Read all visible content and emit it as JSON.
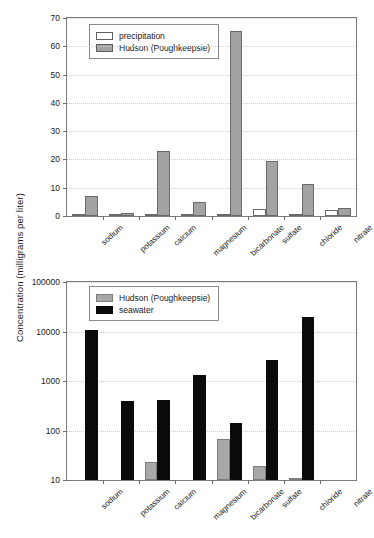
{
  "figure": {
    "y_axis_title": "Concentration (milligrams per liter)"
  },
  "chart_data": [
    {
      "type": "bar",
      "title": "",
      "panel": "top",
      "xlabel": "",
      "ylabel": "Concentration (milligrams per liter)",
      "ylim": [
        0,
        70
      ],
      "yscale": "linear",
      "yticks": [
        0,
        10,
        20,
        30,
        40,
        50,
        60,
        70
      ],
      "ytick_labels": [
        "0",
        "10",
        "20",
        "30",
        "40",
        "50",
        "60",
        "70"
      ],
      "grid": true,
      "legend_position": "upper left",
      "categories": [
        "sodium",
        "potassium",
        "calcium",
        "magnesium",
        "bicarbonate",
        "sulfate",
        "chloride",
        "nitrate"
      ],
      "series": [
        {
          "name": "precipitation",
          "color": "#ffffff",
          "values": [
            0.3,
            0.05,
            0.1,
            0.05,
            0.05,
            2.5,
            0.8,
            2.0
          ]
        },
        {
          "name": "Hudson (Poughkeepsie)",
          "color": "#a3a3a3",
          "values": [
            7.0,
            1.2,
            23.0,
            4.8,
            65.5,
            19.3,
            11.2,
            3.0
          ]
        }
      ]
    },
    {
      "type": "bar",
      "title": "",
      "panel": "bottom",
      "xlabel": "",
      "ylabel": "Concentration (milligrams per liter)",
      "ylim": [
        10,
        100000
      ],
      "yscale": "log",
      "yticks": [
        10,
        100,
        1000,
        10000,
        100000
      ],
      "ytick_labels": [
        "10",
        "100",
        "1000",
        "10000",
        "100000"
      ],
      "grid": true,
      "legend_position": "upper left",
      "categories": [
        "sodium",
        "potassium",
        "calcium",
        "magnesium",
        "bicarbonate",
        "sulfate",
        "chloride",
        "nitrate"
      ],
      "series": [
        {
          "name": "Hudson (Poughkeepsie)",
          "color": "#a8a8a8",
          "values": [
            null,
            null,
            23,
            null,
            68,
            19.3,
            11.2,
            null
          ]
        },
        {
          "name": "seawater",
          "color": "#0b0b0b",
          "values": [
            10800,
            400,
            420,
            1300,
            145,
            2700,
            19400,
            null
          ]
        }
      ]
    }
  ]
}
